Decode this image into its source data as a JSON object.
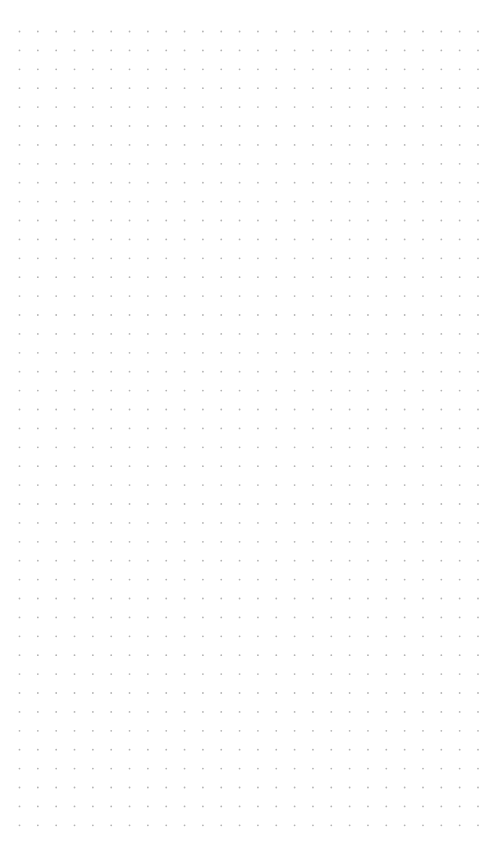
{
  "canvas": {
    "width": 504,
    "height": 866,
    "background": "#ffffff"
  },
  "grid": {
    "type": "dot-grid",
    "dot_color": "#b4b4b4",
    "dot_radius": 0.9,
    "origin_x": 19.5,
    "origin_y": 31.5,
    "step_x": 18.34,
    "step_y": 18.9,
    "columns": 26,
    "rows": 43
  }
}
